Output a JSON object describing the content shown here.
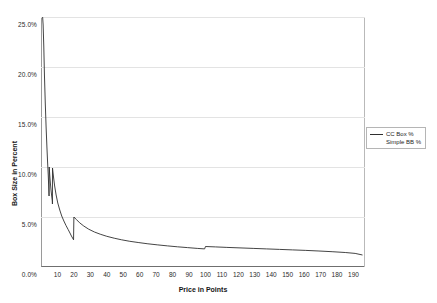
{
  "chart_data": {
    "type": "line",
    "title": "",
    "xlabel": "Price in Points",
    "ylabel": "Box Size in Percent",
    "xlim": [
      0,
      197
    ],
    "ylim": [
      0,
      25
    ],
    "grid": true,
    "legend_position": "right",
    "y_tick_labels": [
      "0.0%",
      "5.0%",
      "10.0%",
      "15.0%",
      "20.0%",
      "25.0%"
    ],
    "y_ticks": [
      0,
      5,
      10,
      15,
      20,
      25
    ],
    "x_tick_labels": [
      "10",
      "20",
      "30",
      "40",
      "50",
      "60",
      "70",
      "80",
      "90",
      "100",
      "110",
      "120",
      "130",
      "140",
      "150",
      "160",
      "170",
      "180",
      "190"
    ],
    "x_ticks": [
      10,
      20,
      30,
      40,
      50,
      60,
      70,
      80,
      90,
      100,
      110,
      120,
      130,
      140,
      150,
      160,
      170,
      180,
      190
    ],
    "series": [
      {
        "name": "CC Box %",
        "color": "#2f2f2f",
        "x": [
          1.0,
          1.3,
          1.7,
          2.1,
          2.6,
          3.1,
          3.6,
          4.0,
          4.4,
          4.7,
          4.9,
          5.0,
          5.3,
          5.7,
          6.1,
          6.5,
          6.9,
          6.95,
          7.0,
          7.6,
          8.3,
          9.2,
          10.2,
          11.4,
          12.6,
          13.9,
          15.2,
          16.5,
          17.6,
          18.5,
          19.2,
          19.8,
          20.0,
          21.5,
          23.5,
          26,
          29,
          32.5,
          36,
          40,
          44.5,
          49,
          54,
          59.5,
          65,
          71,
          77,
          83,
          89,
          95,
          99.5,
          100.0,
          106,
          113,
          121,
          129,
          137,
          145,
          153,
          161,
          169,
          177,
          185,
          191,
          195.5
        ],
        "y": [
          25.0,
          24.2,
          22.0,
          19.2,
          16.4,
          14.0,
          12.0,
          10.5,
          9.2,
          8.0,
          7.1,
          10.0,
          9.2,
          8.4,
          7.7,
          7.1,
          6.6,
          6.3,
          9.9,
          9.0,
          8.1,
          7.2,
          6.4,
          5.7,
          5.1,
          4.6,
          4.15,
          3.75,
          3.4,
          3.1,
          2.9,
          2.72,
          5.0,
          4.75,
          4.42,
          4.1,
          3.78,
          3.5,
          3.28,
          3.07,
          2.88,
          2.72,
          2.57,
          2.44,
          2.32,
          2.21,
          2.11,
          2.02,
          1.94,
          1.86,
          1.81,
          2.05,
          2.01,
          1.96,
          1.91,
          1.86,
          1.81,
          1.76,
          1.71,
          1.66,
          1.6,
          1.53,
          1.45,
          1.36,
          1.2
        ]
      },
      {
        "name": "Simple BB %",
        "color": "#2f2f2f",
        "x": [],
        "y": []
      }
    ],
    "legend": [
      {
        "label": "CC Box %",
        "has_line_sample": true
      },
      {
        "label": "Simple BB %",
        "has_line_sample": false
      }
    ]
  }
}
